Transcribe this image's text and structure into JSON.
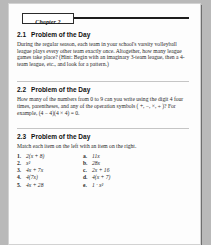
{
  "document": {
    "chapter_tab": "Chapter 2",
    "sections": [
      {
        "number": "2.1",
        "title": "Problem of the Day",
        "body": "During the regular season, each team in your school's varsity volleyball league plays every other team exactly once. Altogether, how many league games take place? (Hint: Begin with an imaginary 3-team league, then a 4-team league, etc., and look for a pattern.)"
      },
      {
        "number": "2.2",
        "title": "Problem of the Day",
        "body": "How many of the numbers from 0 to 9 can you write using the digit 4 four times, parentheses, and any of the operation symbols ( +, −, ×, ÷ )? For example, (4 − 4)(4 × 4) = 0."
      },
      {
        "number": "2.3",
        "title": "Problem of the Day",
        "body": "Match each item on the left with an item on the right."
      }
    ],
    "match_exercise": {
      "left_column": [
        {
          "marker": "1.",
          "expr": "2(x + 8)"
        },
        {
          "marker": "2.",
          "expr": "x²"
        },
        {
          "marker": "3.",
          "expr": "4x + 7x"
        },
        {
          "marker": "4.",
          "expr": "4(7x)"
        },
        {
          "marker": "5.",
          "expr": "4x + 28"
        }
      ],
      "right_column": [
        {
          "marker": "a.",
          "expr": "11x"
        },
        {
          "marker": "b.",
          "expr": "28x"
        },
        {
          "marker": "c.",
          "expr": "2x + 16"
        },
        {
          "marker": "d.",
          "expr": "4(x + 7)"
        },
        {
          "marker": "e.",
          "expr": "1 · x²"
        }
      ]
    }
  }
}
